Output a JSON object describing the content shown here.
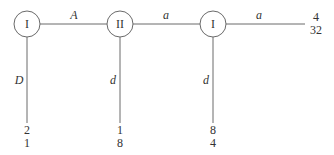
{
  "diagram": {
    "nodes": [
      {
        "id": "n1",
        "label": "I",
        "x": 27,
        "y": 24
      },
      {
        "id": "n2",
        "label": "II",
        "x": 120,
        "y": 24
      },
      {
        "id": "n3",
        "label": "I",
        "x": 213,
        "y": 24
      }
    ],
    "edges": [
      {
        "from": "n1",
        "to": "n2",
        "label": "A"
      },
      {
        "from": "n2",
        "to": "n3",
        "label": "a"
      },
      {
        "from": "n3",
        "to": "end_right",
        "label": "a"
      },
      {
        "from": "n1",
        "to": "end_n1_down",
        "label": "D"
      },
      {
        "from": "n2",
        "to": "end_n2_down",
        "label": "d"
      },
      {
        "from": "n3",
        "to": "end_n3_down",
        "label": "d"
      }
    ],
    "terminals": [
      {
        "id": "end_right",
        "top": "4",
        "bottom": "32"
      },
      {
        "id": "end_n1_down",
        "top": "2",
        "bottom": "1"
      },
      {
        "id": "end_n2_down",
        "top": "1",
        "bottom": "8"
      },
      {
        "id": "end_n3_down",
        "top": "8",
        "bottom": "4"
      }
    ]
  }
}
